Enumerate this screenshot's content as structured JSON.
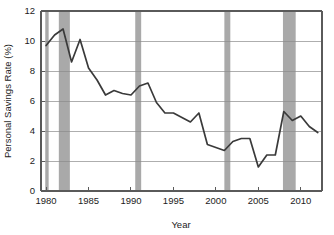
{
  "chart_data": {
    "type": "line",
    "title": "",
    "xlabel": "Year",
    "ylabel": "Personal Savings Rate (%)",
    "xlim": [
      1979.4,
      2012.5
    ],
    "ylim": [
      0,
      12
    ],
    "grid": true,
    "legend": "none",
    "x_ticks": [
      1980,
      1985,
      1990,
      1995,
      2000,
      2005,
      2010
    ],
    "x_tick_labels": [
      "1980",
      "1985",
      "1990",
      "1995",
      "2000",
      "2005",
      "2010"
    ],
    "y_ticks": [
      0,
      2,
      4,
      6,
      8,
      10,
      12
    ],
    "y_tick_labels": [
      "0",
      "2",
      "4",
      "6",
      "8",
      "10",
      "12"
    ],
    "series": [
      {
        "name": "Personal Savings Rate",
        "color": "#3a3a3a",
        "x": [
          1980,
          1981,
          1982,
          1983,
          1984,
          1985,
          1986,
          1987,
          1988,
          1989,
          1990,
          1991,
          1992,
          1993,
          1994,
          1995,
          1996,
          1997,
          1998,
          1999,
          2000,
          2001,
          2002,
          2003,
          2004,
          2005,
          2006,
          2007,
          2008,
          2009,
          2010,
          2011,
          2012
        ],
        "values": [
          9.7,
          10.4,
          10.8,
          8.6,
          10.1,
          8.2,
          7.4,
          6.4,
          6.7,
          6.5,
          6.4,
          7.0,
          7.2,
          5.9,
          5.2,
          5.2,
          4.9,
          4.6,
          5.2,
          3.1,
          2.9,
          2.7,
          3.3,
          3.5,
          3.5,
          1.6,
          2.4,
          2.4,
          5.3,
          4.7,
          5.0,
          4.3,
          3.9
        ],
        "min_value": 1.6,
        "max_value": 10.8
      }
    ],
    "shaded_regions": {
      "label": "Recession periods",
      "color": "#a9a9a9",
      "spans": [
        [
          1979.9,
          1980.3
        ],
        [
          1981.5,
          1982.8
        ],
        [
          1990.5,
          1991.2
        ],
        [
          2001.0,
          2001.7
        ],
        [
          2007.9,
          2009.4
        ]
      ]
    }
  }
}
